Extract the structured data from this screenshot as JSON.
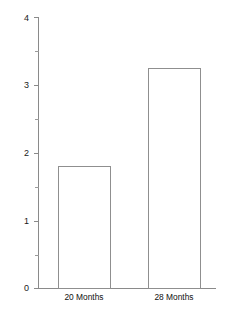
{
  "chart_data": {
    "type": "bar",
    "title": "",
    "subtitle": "",
    "xlabel": "",
    "ylabel": "",
    "categories": [
      "20 Months",
      "28 Months"
    ],
    "values": [
      1.8,
      3.25
    ],
    "ylim": [
      0,
      4
    ],
    "y_major_ticks": [
      0,
      1,
      2,
      3,
      4
    ],
    "y_major_tick_labels": [
      "0",
      "1",
      "2",
      "3",
      "4"
    ],
    "y_minor_ticks": [
      0.5,
      1.5,
      2.5,
      3.5
    ],
    "grid": false,
    "legend": null,
    "legend_position": "none",
    "bar_fill_color": "#ffffff",
    "bar_edge_color": "#8f8f8f",
    "axis_color": "#8a8a8a",
    "background_color": "#ffffff",
    "annotations": []
  },
  "axis": {
    "y_tick_0": "0",
    "y_tick_1": "1",
    "y_tick_2": "2",
    "y_tick_3": "3",
    "y_tick_4": "4"
  },
  "bars": {
    "bar_0_label": "20 Months",
    "bar_1_label": "28 Months"
  }
}
